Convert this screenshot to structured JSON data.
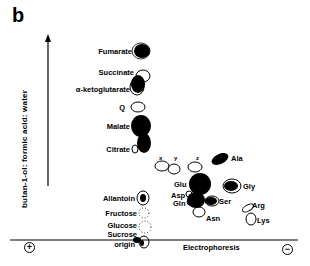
{
  "figure": {
    "panel_label": "b",
    "y_axis_label": "butan-1-ol: formic acid: water",
    "x_axis_label": "Electrophoresis",
    "anode_sign": "+",
    "cathode_sign": "−",
    "origin_label": "origin"
  },
  "spots": {
    "fumarate": "Fumarate",
    "succinate": "Succinate",
    "ketoglutarate": "α-ketoglutarate",
    "q": "Q",
    "malate": "Malate",
    "citrate": "Citrate",
    "allantoin": "Allantoin",
    "fructose": "Fructose",
    "glucose": "Glucose",
    "sucrose": "Sucrose",
    "x": "x",
    "y": "y",
    "z": "z",
    "ala": "Ala",
    "glu": "Glu",
    "asp": "Asp",
    "gln": "Gln",
    "gly": "Gly",
    "ser": "Ser",
    "asn": "Asn",
    "arg": "Arg",
    "lys": "Lys"
  }
}
